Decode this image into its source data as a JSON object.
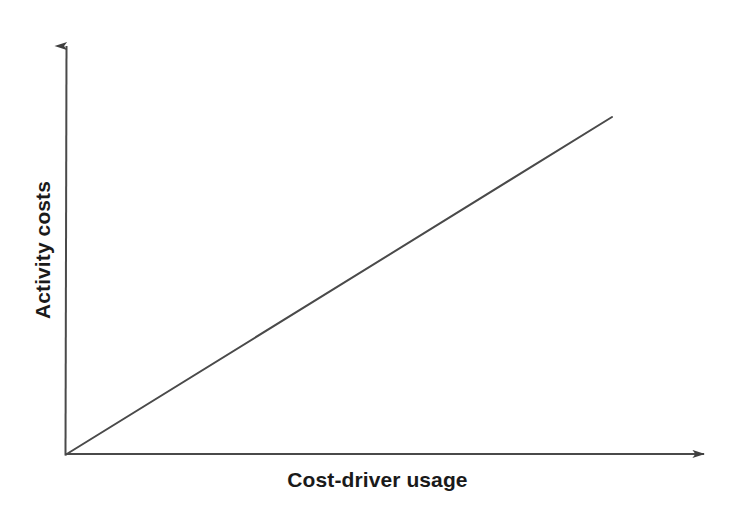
{
  "chart_data": {
    "type": "line",
    "title": "",
    "subtitle": "",
    "xlabel": "Cost-driver usage",
    "ylabel": "Activity costs",
    "series": [
      {
        "name": "Activity cost behavior",
        "x": [
          0,
          1
        ],
        "values": [
          0,
          1
        ],
        "style": "solid-straight-line",
        "color": "#4a4a4a"
      }
    ],
    "x": [
      0,
      1
    ],
    "categories": [],
    "xlim": [
      0,
      1
    ],
    "ylim": [
      0,
      1
    ],
    "xticks": [],
    "yticks": [],
    "xticklabels": [],
    "yticklabels": [],
    "grid": false,
    "legend": false,
    "legend_position": "none",
    "annotations": [],
    "axis_style": "arrow-headed open axes (no ticks, no numeric scale)"
  },
  "axes": {
    "x_axis_name": "Cost-driver usage",
    "y_axis_name": "Activity costs",
    "origin_label": "",
    "arrowheads": {
      "x": "arrow-right-icon",
      "y": "arrow-up-icon"
    }
  },
  "colors": {
    "background": "#ffffff",
    "axis": "#4a4a4a",
    "line": "#4a4a4a",
    "text": "#1a1a1a"
  },
  "geometry": {
    "origin": {
      "x": 65,
      "y": 455
    },
    "y_axis_tip": {
      "x": 66,
      "y": 33
    },
    "x_axis_tip": {
      "x": 716,
      "y": 453
    },
    "line_end": {
      "x": 612,
      "y": 117
    }
  }
}
